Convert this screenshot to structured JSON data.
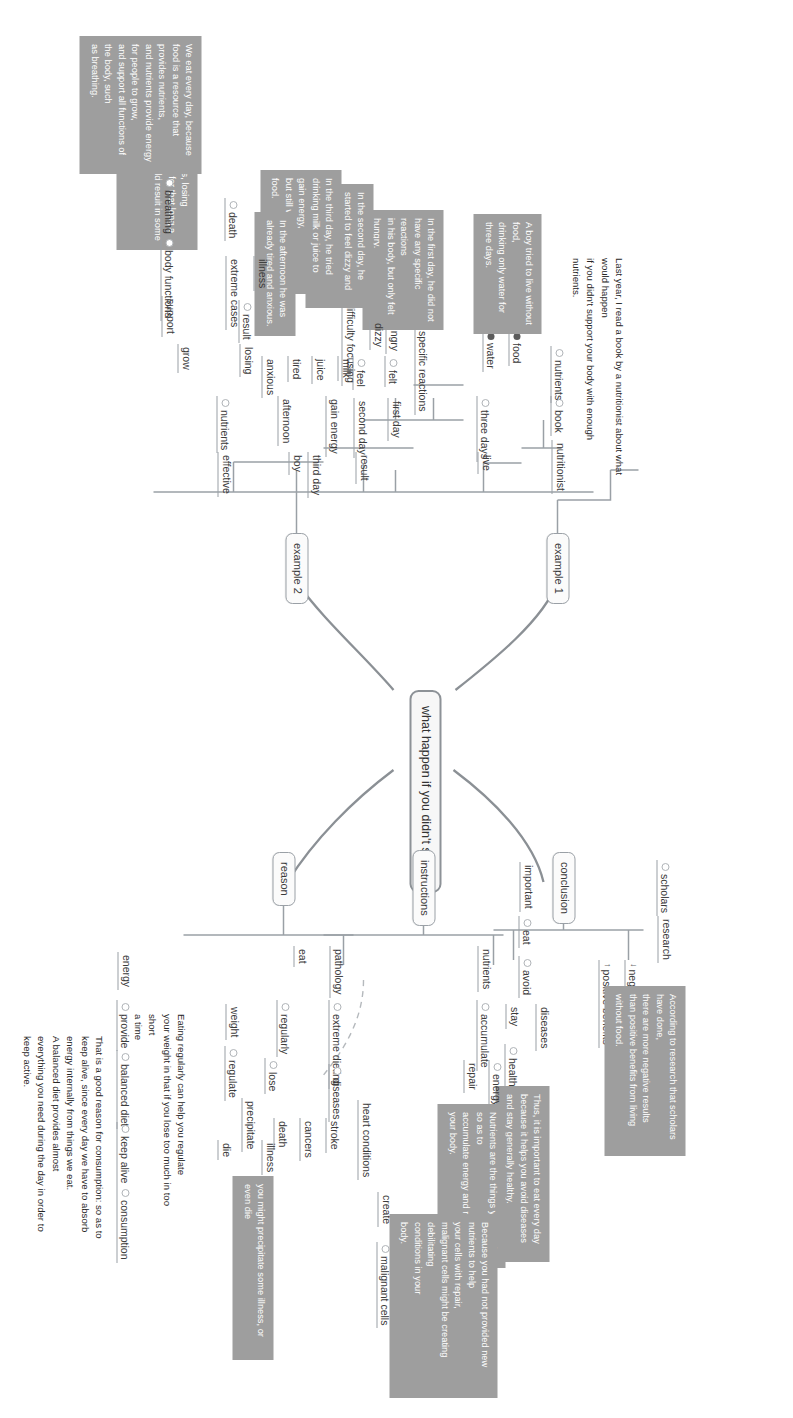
{
  "diagram": {
    "title": "what happen if you didn't sleep",
    "type": "mind-map"
  },
  "central": {
    "label": "what happen if you didn't sleep"
  },
  "branches": {
    "example1": "example 1",
    "example2": "example 2",
    "conclusion": "conclusion",
    "instructions": "instructions",
    "reason": "reason"
  },
  "example1": {
    "nodes": {
      "nutritionist": "nutritionist",
      "book": "book",
      "nutrients": "nutrients"
    },
    "note": "Last year, I read a book by a nutritionist about what\nwould happen\nif you didn't support your body with enough\nnutrients."
  },
  "example2": {
    "nodes": {
      "boy": "boy",
      "live": "live",
      "three_days": "three days",
      "food": "food",
      "water": "water",
      "result": "result",
      "first_day": "first day",
      "specific_reactions": "specific reactions",
      "felt": "felt",
      "hungry": "hungry",
      "second_day": "second day",
      "feel": "feel",
      "dizzy": "dizzy",
      "difficulty_focusing": "difficulty focusing",
      "third_day": "third day",
      "gain_energy": "gain energy",
      "milk": "milk",
      "juice": "juice",
      "afternoon": "afternoon",
      "tired": "tired",
      "anxious": "anxious",
      "effective": "effective",
      "nutrients": "nutrients",
      "losing": "losing",
      "result2": "result",
      "illness": "illness",
      "extreme_cases": "extreme cases",
      "death": "death",
      "grow": "grow",
      "support": "support",
      "body_functions": "body functions",
      "breathing": "breathing"
    },
    "notes": {
      "boy_story": "A boy tried to live without food,\ndrinking only water for three days.",
      "day1": "In the first day, he did not have any specific reactions\nin his body, but only felt hungry.",
      "day2": "In the second day, he started to feel dizzy and had\ndifficulty focusing.",
      "day3": "In the third day, he tried drinking milk or juice to gain energy,\nbut still wasn't without food.",
      "afternoon": "In the afternoon he was already tired and anxious.",
      "others": "for others, losing nutrients for that long a\ntime could result in some illness.\nand 6.",
      "nutrition": "We eat every day, because food is a resource that\nprovides nutrients,\nand nutrients provide energy for people to grow,\nand support all functions of the body, such\nas breathing."
    }
  },
  "conclusion": {
    "nodes": {
      "negative_result": "negative result",
      "positive_benefits": "positive benefits",
      "research": "research",
      "scholars": "scholars",
      "important": "important",
      "eat": "eat",
      "avoid": "avoid",
      "diseases": "diseases",
      "stay": "stay",
      "healthy": "healthy"
    },
    "notes": {
      "research_note": "According to research that scholars have done,\nthere are more negative results\nthan positive benefits from living without food.",
      "eat_note": "Thus, it is important to eat every day\nbecause it helps you avoid diseases and stay generally healthy."
    }
  },
  "instructions": {
    "nodes": {
      "nutrients": "nutrients",
      "accumulate": "accumulate",
      "energy": "energy",
      "repair": "repair",
      "pathology": "pathology",
      "extreme_dieting": "extreme dieting",
      "diseases": "diseases",
      "heart_conditions": "heart conditions",
      "stroke": "stroke",
      "cancers": "cancers",
      "death": "death",
      "create": "create",
      "malignant_cells": "malignant cells"
    },
    "notes": {
      "nutrients_note": "Nutrients are the things you need so as to\naccumulate energy and repair\nyour body.",
      "malignant_note": "Because you had not provided new nutrients to help\nyour cells with repair,\nmalignant cells might be creating debilitating\nconditions in your\nbody."
    }
  },
  "reason": {
    "nodes": {
      "eat": "eat",
      "regularly": "regularly",
      "lose": "lose",
      "weight": "weight",
      "regulate": "regulate",
      "precipitate": "precipitate",
      "illness": "illness",
      "die": "die",
      "energy": "energy",
      "provide": "provide",
      "balanced_diet": "balanced diet",
      "keep_alive": "keep alive",
      "consumption": "consumption"
    },
    "notes": {
      "regulate_note": "Eating regularly can help you regulate\nyour weight in that if you lose too much in too short\na time",
      "illness_note": "you might precipitate some illness, or even die",
      "consumption_note": "That is a good reason for consumption: so as to\nkeep alive, since every day we have to absorb\nenergy internally from things we eat.\nA balanced diet provides almost\neverything you need during the day in order to\nkeep active."
    }
  }
}
